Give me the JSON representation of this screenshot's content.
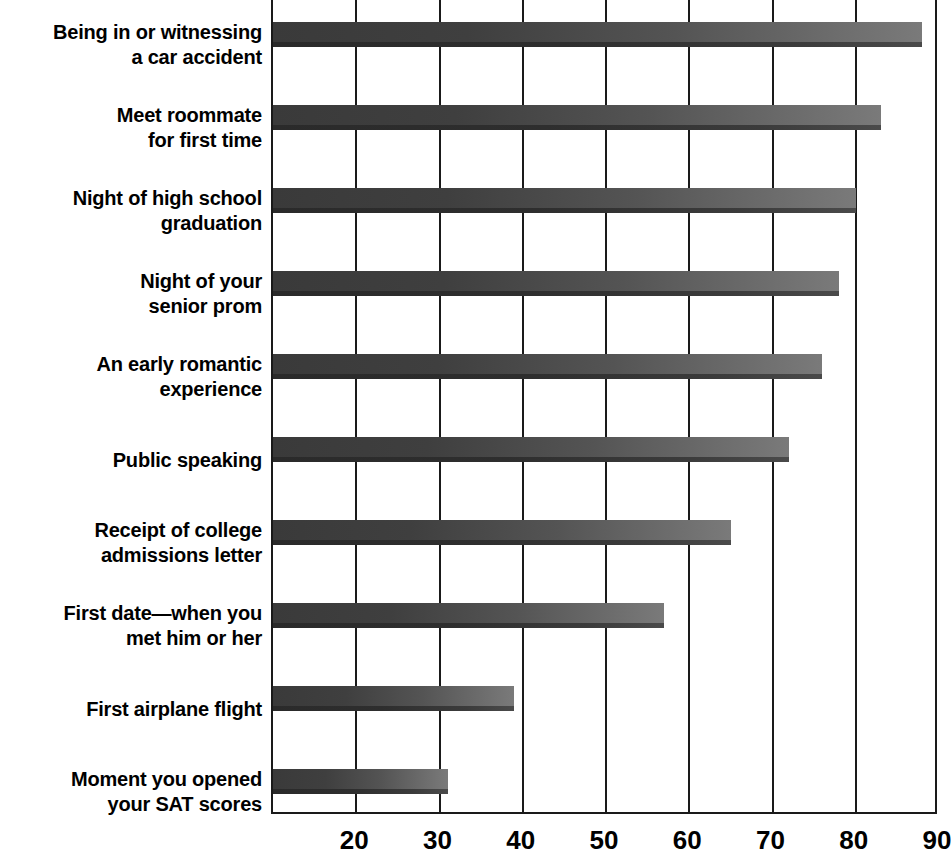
{
  "chart_data": {
    "type": "bar",
    "orientation": "horizontal",
    "title": "",
    "subtitle": "",
    "xlabel": "",
    "ylabel": "",
    "xlim": [
      10,
      90
    ],
    "grid": true,
    "legend": null,
    "xticks": [
      20,
      30,
      40,
      50,
      60,
      70,
      80,
      90
    ],
    "xtick_labels": [
      "20",
      "30",
      "40",
      "50",
      "60",
      "70",
      "80",
      "90"
    ],
    "categories": [
      "Being in or witnessing\na car accident",
      "Meet roommate\nfor first time",
      "Night of high school\ngraduation",
      "Night of your\nsenior prom",
      "An early romantic\nexperience",
      "Public speaking",
      "Receipt of college\nadmissions letter",
      "First date—when you\nmet him or her",
      "First airplane flight",
      "Moment you opened\nyour SAT scores"
    ],
    "values": [
      88,
      83,
      80,
      78,
      76,
      72,
      65,
      57,
      39,
      31
    ],
    "bar_color": "#4a4a4a",
    "bar_highlight_color": "#7a7a7a",
    "bar_shadow_color": "#2a2a2a",
    "axis_color": "#1a1a1a",
    "background_color": "#ffffff"
  }
}
